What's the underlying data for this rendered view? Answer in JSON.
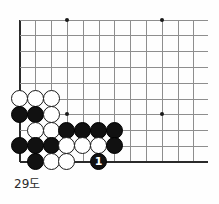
{
  "diagram": {
    "caption": "29도",
    "kind": "go-board-diagram",
    "board": {
      "origin_x": 19.5,
      "origin_y": 19.5,
      "spacing": 15.8,
      "cols": 12,
      "rows": 10,
      "edges": [
        "left",
        "bottom"
      ],
      "line_color": "#8e8e8e",
      "edge_color": "#2a2a2a",
      "background": "#fefefe"
    },
    "star_points": [
      {
        "col": 4,
        "row": 1
      },
      {
        "col": 10,
        "row": 1
      },
      {
        "col": 4,
        "row": 7
      },
      {
        "col": 10,
        "row": 7
      }
    ],
    "stones": [
      {
        "col": 1,
        "row": 6,
        "color": "white"
      },
      {
        "col": 2,
        "row": 6,
        "color": "white"
      },
      {
        "col": 3,
        "row": 6,
        "color": "white"
      },
      {
        "col": 1,
        "row": 7,
        "color": "black"
      },
      {
        "col": 2,
        "row": 7,
        "color": "black"
      },
      {
        "col": 3,
        "row": 7,
        "color": "white"
      },
      {
        "col": 2,
        "row": 8,
        "color": "white"
      },
      {
        "col": 3,
        "row": 8,
        "color": "white"
      },
      {
        "col": 4,
        "row": 8,
        "color": "black"
      },
      {
        "col": 5,
        "row": 8,
        "color": "black"
      },
      {
        "col": 6,
        "row": 8,
        "color": "black"
      },
      {
        "col": 7,
        "row": 8,
        "color": "black"
      },
      {
        "col": 1,
        "row": 9,
        "color": "black"
      },
      {
        "col": 2,
        "row": 9,
        "color": "black"
      },
      {
        "col": 3,
        "row": 9,
        "color": "black"
      },
      {
        "col": 4,
        "row": 9,
        "color": "white"
      },
      {
        "col": 5,
        "row": 9,
        "color": "white"
      },
      {
        "col": 6,
        "row": 9,
        "color": "white"
      },
      {
        "col": 7,
        "row": 9,
        "color": "black"
      },
      {
        "col": 2,
        "row": 10,
        "color": "black"
      },
      {
        "col": 3,
        "row": 10,
        "color": "white"
      },
      {
        "col": 4,
        "row": 10,
        "color": "white"
      },
      {
        "col": 6,
        "row": 10,
        "color": "black",
        "label": "1"
      }
    ]
  }
}
